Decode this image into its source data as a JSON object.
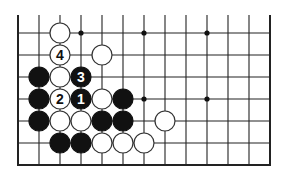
{
  "diagram": {
    "type": "go-board-fragment",
    "grid": {
      "x0": 18,
      "y0": 33,
      "dx": 21,
      "dy": 22,
      "cols": 13,
      "rows": 6,
      "top_y": 15,
      "bottom_y": 165
    },
    "star_points": [
      [
        3,
        0
      ],
      [
        6,
        0
      ],
      [
        9,
        0
      ],
      [
        6,
        3
      ],
      [
        9,
        3
      ]
    ],
    "stones": [
      {
        "c": 2,
        "r": 0,
        "color": "white",
        "label": ""
      },
      {
        "c": 2,
        "r": 1,
        "color": "white",
        "label": "4"
      },
      {
        "c": 4,
        "r": 1,
        "color": "white",
        "label": ""
      },
      {
        "c": 1,
        "r": 2,
        "color": "black",
        "label": ""
      },
      {
        "c": 2,
        "r": 2,
        "color": "white",
        "label": ""
      },
      {
        "c": 3,
        "r": 2,
        "color": "black",
        "label": "3"
      },
      {
        "c": 1,
        "r": 3,
        "color": "black",
        "label": ""
      },
      {
        "c": 2,
        "r": 3,
        "color": "white",
        "label": "2"
      },
      {
        "c": 3,
        "r": 3,
        "color": "black",
        "label": "1"
      },
      {
        "c": 4,
        "r": 3,
        "color": "white",
        "label": ""
      },
      {
        "c": 5,
        "r": 3,
        "color": "black",
        "label": ""
      },
      {
        "c": 1,
        "r": 4,
        "color": "black",
        "label": ""
      },
      {
        "c": 2,
        "r": 4,
        "color": "white",
        "label": ""
      },
      {
        "c": 3,
        "r": 4,
        "color": "white",
        "label": ""
      },
      {
        "c": 4,
        "r": 4,
        "color": "black",
        "label": ""
      },
      {
        "c": 5,
        "r": 4,
        "color": "black",
        "label": ""
      },
      {
        "c": 7,
        "r": 4,
        "color": "white",
        "label": ""
      },
      {
        "c": 2,
        "r": 5,
        "color": "black",
        "label": ""
      },
      {
        "c": 3,
        "r": 5,
        "color": "black",
        "label": ""
      },
      {
        "c": 4,
        "r": 5,
        "color": "white",
        "label": ""
      },
      {
        "c": 5,
        "r": 5,
        "color": "white",
        "label": ""
      },
      {
        "c": 6,
        "r": 5,
        "color": "white",
        "label": ""
      }
    ]
  }
}
